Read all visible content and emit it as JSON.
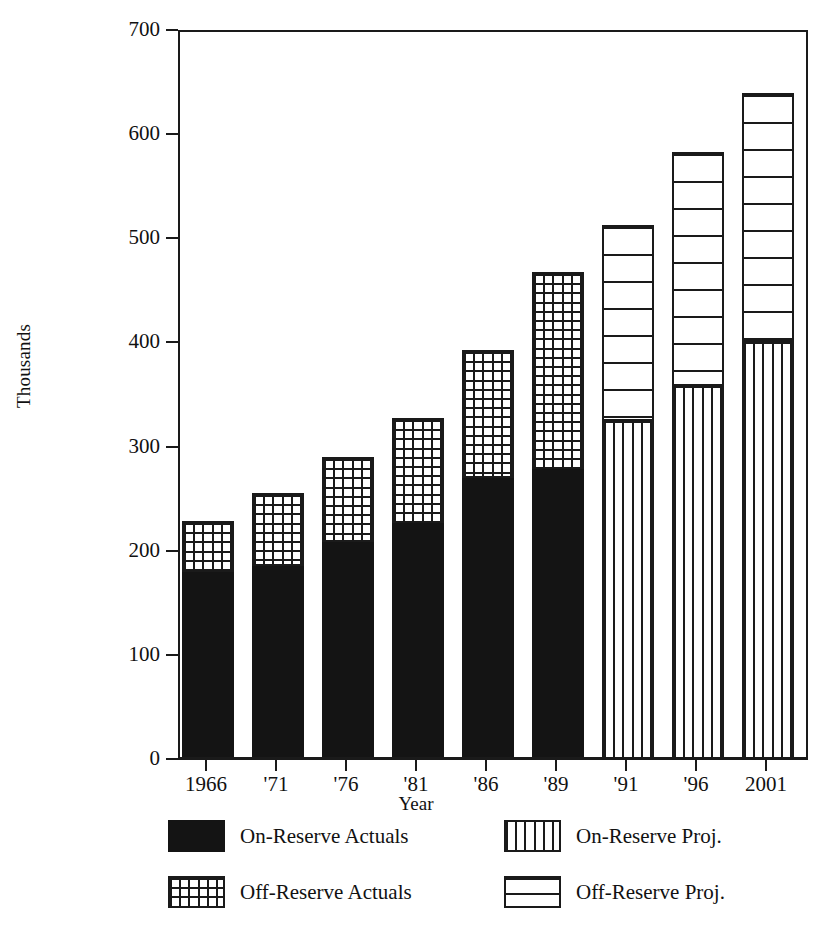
{
  "chart_data": {
    "type": "bar",
    "title": "",
    "subtitle": "",
    "xlabel": "Year",
    "ylabel": "Thousands",
    "ylim": [
      0,
      700
    ],
    "yticks": [
      0,
      100,
      200,
      300,
      400,
      500,
      600,
      700
    ],
    "ytick_labels": [
      "0",
      "100",
      "200",
      "300",
      "400",
      "500",
      "600",
      "700"
    ],
    "grid": false,
    "stacked": true,
    "legend_position": "bottom",
    "categories": [
      "1966",
      "'71",
      "'76",
      "'81",
      "'86",
      "'89",
      "'91",
      "'96",
      "2001"
    ],
    "series": [
      {
        "name": "On-Reserve Actuals",
        "pattern": "solid-black",
        "values": [
          180,
          185,
          208,
          227,
          270,
          278,
          null,
          null,
          null
        ]
      },
      {
        "name": "Off-Reserve Actuals",
        "pattern": "cross-hatch",
        "values": [
          49,
          70,
          82,
          100,
          123,
          190,
          null,
          null,
          null
        ]
      },
      {
        "name": "On-Reserve Proj.",
        "pattern": "vertical-lines",
        "values": [
          null,
          null,
          null,
          null,
          null,
          null,
          325,
          358,
          400
        ]
      },
      {
        "name": "Off-Reserve Proj.",
        "pattern": "horizontal-lines",
        "values": [
          null,
          null,
          null,
          null,
          null,
          null,
          188,
          225,
          240
        ]
      }
    ],
    "totals": [
      229,
      255,
      290,
      327,
      393,
      468,
      513,
      583,
      640
    ]
  },
  "legend": {
    "items": [
      {
        "label": "On-Reserve  Actuals",
        "swatch": "solid-black-swatch"
      },
      {
        "label": "On-Reserve  Proj.",
        "swatch": "vertical-lines-swatch"
      },
      {
        "label": "Off-Reserve  Actuals",
        "swatch": "cross-hatch-swatch"
      },
      {
        "label": "Off-Reserve  Proj.",
        "swatch": "horizontal-lines-swatch"
      }
    ]
  },
  "colors": {
    "ink": "#1a1a1a",
    "fill_black": "#141414",
    "background": "#ffffff"
  }
}
